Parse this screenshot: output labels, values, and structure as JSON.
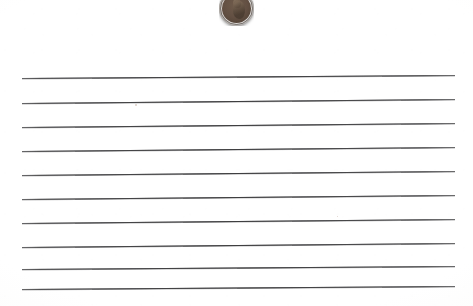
{
  "scene": {
    "title": "Lined notebook paper with a penny",
    "description": "Scanned sheet of wide-ruled lined paper with a US Lincoln one-cent coin resting near the top center",
    "width": 473,
    "height": 306,
    "background_color": "#fefefe",
    "paper_tint": "#fbfbfa"
  },
  "paper": {
    "label": "ruled-paper-sheet",
    "line_color": "#5d5d5f",
    "line_count": 10,
    "line_left_x": 22,
    "line_right_x": 455,
    "line_spacing_px": 24,
    "lines": [
      {
        "index": 1,
        "y_left": 78,
        "y_right": 75
      },
      {
        "index": 2,
        "y_left": 103,
        "y_right": 99
      },
      {
        "index": 3,
        "y_left": 127,
        "y_right": 123
      },
      {
        "index": 4,
        "y_left": 151,
        "y_right": 147
      },
      {
        "index": 5,
        "y_left": 175,
        "y_right": 171
      },
      {
        "index": 6,
        "y_left": 199,
        "y_right": 195
      },
      {
        "index": 7,
        "y_left": 223,
        "y_right": 219
      },
      {
        "index": 8,
        "y_left": 247,
        "y_right": 243
      },
      {
        "index": 9,
        "y_left": 269,
        "y_right": 266
      },
      {
        "index": 10,
        "y_left": 289,
        "y_right": 286
      }
    ]
  },
  "coin": {
    "label": "lincoln-penny",
    "denomination": "one cent",
    "obverse_subject": "Abraham Lincoln bust facing right",
    "center_x": 236,
    "center_y": 8,
    "diameter_px": 35,
    "metal_color": "#6c5746",
    "highlight_color": "#8c7664",
    "shadow_color": "#3d3129",
    "clipped_by_top_edge": true
  },
  "marks": {
    "specks": [
      {
        "name": "scan-speck-1",
        "x": 135,
        "y": 104,
        "size": 2
      },
      {
        "name": "scan-speck-2",
        "x": 337,
        "y": 216,
        "size": 1
      }
    ]
  }
}
